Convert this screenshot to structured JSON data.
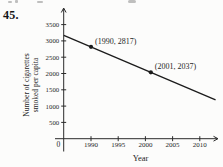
{
  "problem_number": "45.",
  "chart_data": {
    "type": "line",
    "title": "",
    "xlabel": "Year",
    "ylabel": "Number of cigarettes smoked per capita",
    "ylabel_lines": [
      "Number of cigarettes",
      "smoked per capita"
    ],
    "x_ticks": [
      "1990",
      "1995",
      "2000",
      "2005",
      "2010"
    ],
    "y_ticks": [
      "500",
      "1000",
      "1500",
      "2000",
      "2500",
      "3000",
      "3500"
    ],
    "origin_tick_label": "0",
    "x_axis_range_years": [
      1985,
      2013.5
    ],
    "y_axis_range": [
      0,
      3700
    ],
    "grid": false,
    "legend": false,
    "series": [
      {
        "name": "cigarettes-per-capita-trend",
        "points": [
          {
            "x": 1990,
            "y": 2817,
            "label": "(1990, 2817)"
          },
          {
            "x": 2001,
            "y": 2037,
            "label": "(2001, 2037)"
          }
        ],
        "line_extends_through_years": [
          1985.0,
          2012.9
        ]
      }
    ],
    "colors": {
      "line": "#1b1b1b",
      "axis": "#2a2a2a",
      "text": "#1f1f1f",
      "background": "#fcfcfb"
    }
  }
}
